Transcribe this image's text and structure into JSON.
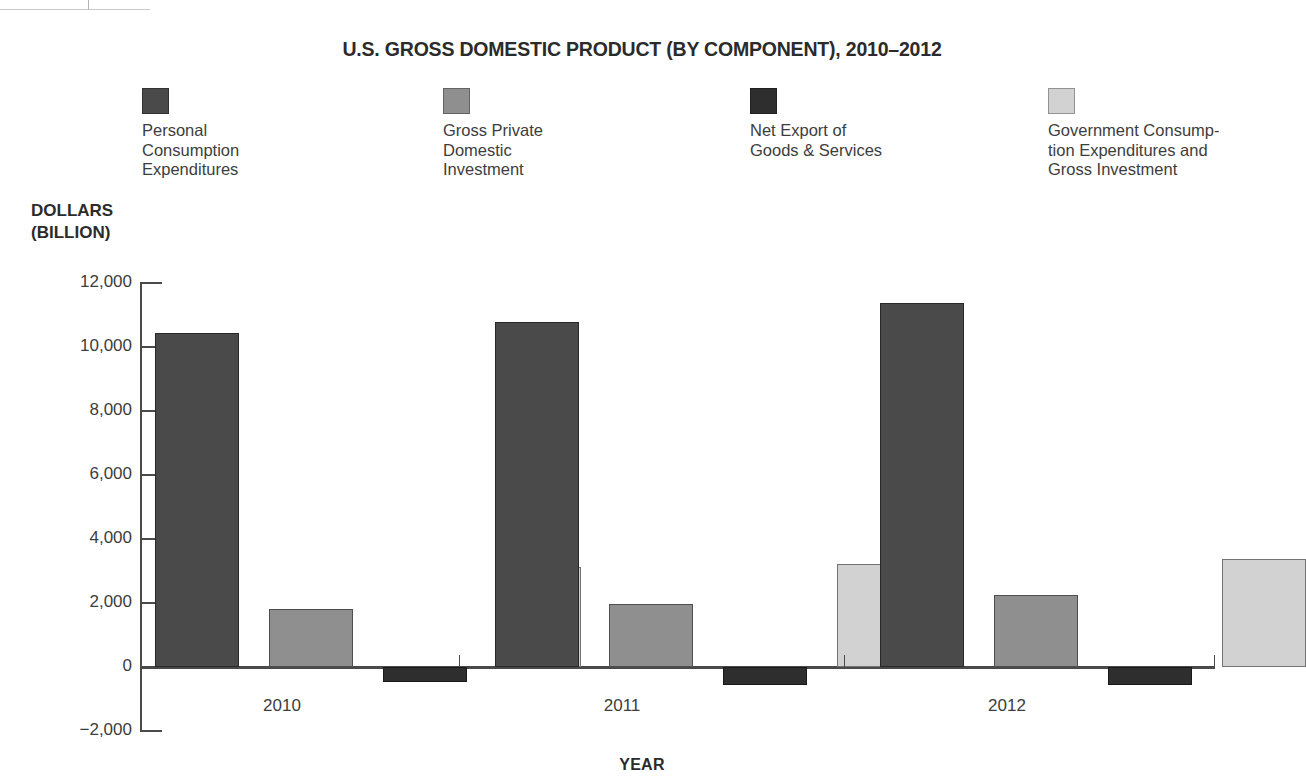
{
  "chart_data": {
    "type": "bar",
    "title": "U.S. GROSS DOMESTIC PRODUCT (BY COMPONENT), 2010–2012",
    "xlabel": "YEAR",
    "ylabel": "DOLLARS\n(BILLION)",
    "categories": [
      "2010",
      "2011",
      "2012"
    ],
    "ylim": [
      -2000,
      12000
    ],
    "ytick_labels": [
      "12,000",
      "10,000",
      "8,000",
      "6,000",
      "4,000",
      "2,000",
      "0",
      "−2,000"
    ],
    "ytick_values": [
      12000,
      10000,
      8000,
      6000,
      4000,
      2000,
      0,
      -2000
    ],
    "grid": false,
    "legend_position": "top",
    "series": [
      {
        "name": "Personal\nConsumption\nExpenditures",
        "color": "#4a4a4a",
        "values": [
          10430,
          10780,
          11370
        ]
      },
      {
        "name": "Gross Private\nDomestic\nInvestment",
        "color": "#8f8f8f",
        "values": [
          1800,
          1960,
          2250
        ]
      },
      {
        "name": "Net Export of\nGoods & Services",
        "color": "#2e2e2e",
        "values": [
          -470,
          -570,
          -550
        ]
      },
      {
        "name": "Government Consump-\ntion Expenditures and\nGross Investment",
        "color": "#d2d2d2",
        "values": [
          3120,
          3220,
          3380
        ]
      }
    ]
  }
}
